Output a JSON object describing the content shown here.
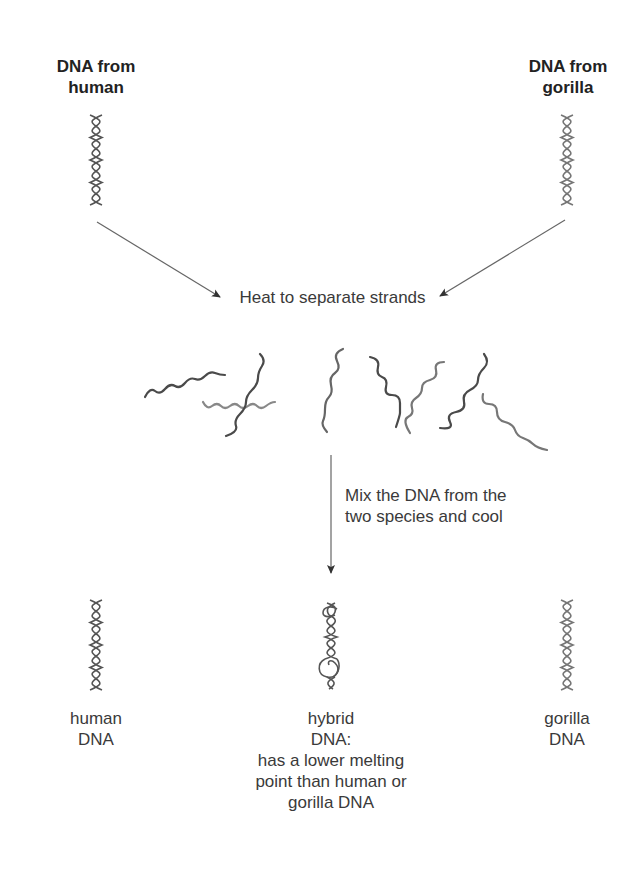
{
  "diagram": {
    "type": "process-flow"
  },
  "sources": {
    "human": {
      "lines": [
        "DNA from",
        "human"
      ],
      "icon": "dna-double-helix-icon"
    },
    "gorilla": {
      "lines": [
        "DNA from",
        "gorilla"
      ],
      "icon": "dna-double-helix-icon"
    }
  },
  "steps": {
    "heat": {
      "text": "Heat to separate strands"
    },
    "mix": {
      "lines": [
        "Mix the DNA from the",
        "two species and cool"
      ]
    }
  },
  "separated_strands": {
    "icon": "single-dna-strands-icon",
    "count": 9
  },
  "results": {
    "human": {
      "lines": [
        "human",
        "DNA"
      ],
      "icon": "dna-double-helix-icon"
    },
    "hybrid": {
      "lines": [
        "hybrid",
        "DNA:",
        "has a lower melting",
        "point than human or",
        "gorilla DNA"
      ],
      "icon": "hybrid-dna-helix-icon"
    },
    "gorilla": {
      "lines": [
        "gorilla",
        "DNA"
      ],
      "icon": "dna-double-helix-icon"
    }
  },
  "colors": {
    "text": "#3a3a3a",
    "heading": "#222222",
    "strand_dark": "#4a4a4a",
    "strand_light": "#7a7a7a",
    "arrow": "#555555"
  }
}
